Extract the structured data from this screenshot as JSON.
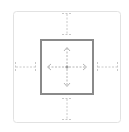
{
  "widget": {
    "type": "box-model-spacing-control",
    "colors": {
      "background": "#ffffff",
      "outer_border": "#e2e2e2",
      "inner_border": "#8a8a8a",
      "dashed_marker": "#c4c4c4",
      "center_marker": "#b0b0b0"
    },
    "icons": {
      "outer": "margin-box-icon",
      "inner": "padding-box-icon",
      "center": "move-arrows-icon"
    }
  }
}
